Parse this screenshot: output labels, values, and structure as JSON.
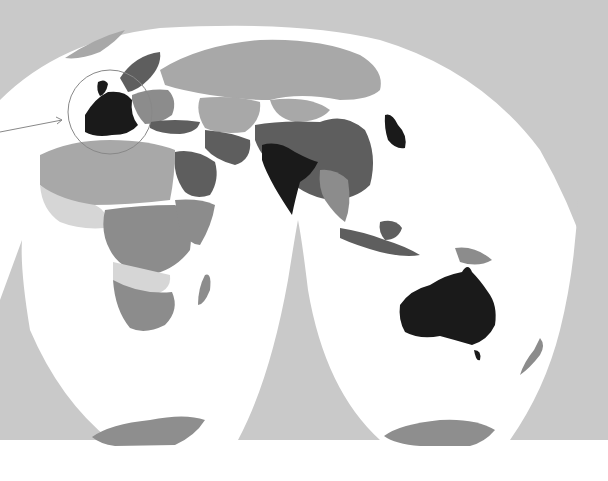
{
  "map": {
    "type": "choropleth",
    "projection": "interrupted homolosine (eastern hemisphere lobes)",
    "colors": {
      "ocean_outside": "#c9c9c9",
      "ocean_inside": "#ffffff",
      "bottom_strip": "#ffffff",
      "level_1_lightest": "#d6d6d6",
      "level_2": "#a8a8a8",
      "level_3": "#8c8c8c",
      "level_4": "#5e5e5e",
      "level_5_darkest": "#1a1a1a",
      "antarctica": "#8e8e8e",
      "callout": "#888888"
    },
    "callout": {
      "shape": "circle",
      "target": "Western Europe",
      "has_arrow": true
    },
    "regions": [
      {
        "name": "Western Europe (UK, France, Germany, Spain, Italy, Benelux)",
        "level": 5
      },
      {
        "name": "Scandinavia",
        "level": 4
      },
      {
        "name": "Eastern Europe",
        "level": 3
      },
      {
        "name": "Russia",
        "level": 2
      },
      {
        "name": "Central Asia",
        "level": 2
      },
      {
        "name": "Mongolia",
        "level": 2
      },
      {
        "name": "China",
        "level": 4
      },
      {
        "name": "Japan",
        "level": 5
      },
      {
        "name": "India",
        "level": 5
      },
      {
        "name": "Middle East / Saudi Arabia",
        "level": 4
      },
      {
        "name": "Iran",
        "level": 4
      },
      {
        "name": "Southeast Asia",
        "level": 3
      },
      {
        "name": "Indonesia",
        "level": 4
      },
      {
        "name": "Australia",
        "level": 5
      },
      {
        "name": "New Zealand",
        "level": 3
      },
      {
        "name": "North Africa",
        "level": 2
      },
      {
        "name": "West Africa",
        "level": 1
      },
      {
        "name": "Central Africa",
        "level": 3
      },
      {
        "name": "Southern Africa",
        "level": 3
      },
      {
        "name": "Madagascar",
        "level": 3
      },
      {
        "name": "Antarctica",
        "level": 3
      }
    ]
  }
}
